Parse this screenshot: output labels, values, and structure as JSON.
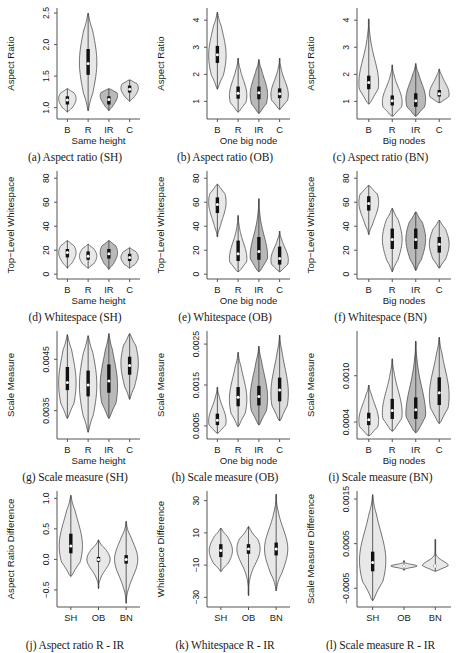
{
  "figure": {
    "title": "",
    "rows": 4,
    "cols": 3,
    "colors": {
      "fill_light": "#e8e8e8",
      "fill_mid": "#dcdcdc",
      "fill_dark": "#b9b9b9",
      "stroke": "#3a3a3a",
      "box": "#111111",
      "median": "#ffffff",
      "axis": "#555555"
    }
  },
  "chart_data": [
    {
      "id": "a",
      "type": "violin",
      "caption": "(a) Aspect ratio (SH)",
      "ylabel": "Aspect Ratio",
      "xlabel": "Same height",
      "categories": [
        "B",
        "R",
        "IR",
        "C"
      ],
      "yticks": [
        1.0,
        1.5,
        2.0,
        2.5
      ],
      "yticklabels": [
        "1.0",
        "1.5",
        "2.0",
        "2.5"
      ],
      "ylim": [
        0.82,
        2.58
      ],
      "series": [
        {
          "name": "B",
          "shade": "fill_light",
          "min": 0.93,
          "max": 1.3,
          "q1": 1.05,
          "q3": 1.18,
          "median": 1.12,
          "peak": 1.14,
          "width": 0.66,
          "bulge": 0.8
        },
        {
          "name": "R",
          "shade": "fill_light",
          "min": 0.95,
          "max": 2.5,
          "q1": 1.52,
          "q3": 1.93,
          "median": 1.7,
          "peak": 1.72,
          "width": 1.0,
          "bulge": 0.55
        },
        {
          "name": "IR",
          "shade": "fill_dark",
          "min": 0.95,
          "max": 1.3,
          "q1": 1.05,
          "q3": 1.18,
          "median": 1.13,
          "peak": 1.19,
          "width": 0.62,
          "bulge": 0.85
        },
        {
          "name": "C",
          "shade": "fill_mid",
          "min": 1.1,
          "max": 1.44,
          "q1": 1.24,
          "q3": 1.35,
          "median": 1.29,
          "peak": 1.31,
          "width": 0.6,
          "bulge": 0.82
        }
      ]
    },
    {
      "id": "b",
      "type": "violin",
      "caption": "(b) Aspect ratio (OB)",
      "ylabel": "Aspect Ratio",
      "xlabel": "One big node",
      "categories": [
        "B",
        "R",
        "IR",
        "C"
      ],
      "yticks": [
        1,
        2,
        3,
        4
      ],
      "yticklabels": [
        "1",
        "2",
        "3",
        "4"
      ],
      "ylim": [
        0.35,
        4.45
      ],
      "series": [
        {
          "name": "B",
          "shade": "fill_light",
          "min": 1.45,
          "max": 4.3,
          "q1": 2.42,
          "q3": 3.05,
          "median": 2.72,
          "peak": 2.7,
          "width": 0.9,
          "bulge": 0.6
        },
        {
          "name": "R",
          "shade": "fill_light",
          "min": 0.6,
          "max": 2.6,
          "q1": 1.1,
          "q3": 1.55,
          "median": 1.3,
          "peak": 1.22,
          "width": 0.8,
          "bulge": 0.55
        },
        {
          "name": "IR",
          "shade": "fill_dark",
          "min": 0.55,
          "max": 2.55,
          "q1": 1.08,
          "q3": 1.55,
          "median": 1.32,
          "peak": 1.25,
          "width": 0.82,
          "bulge": 0.6
        },
        {
          "name": "C",
          "shade": "fill_mid",
          "min": 0.7,
          "max": 2.6,
          "q1": 1.12,
          "q3": 1.48,
          "median": 1.28,
          "peak": 1.25,
          "width": 0.74,
          "bulge": 0.5
        }
      ]
    },
    {
      "id": "c",
      "type": "violin",
      "caption": "(c) Aspect ratio (BN)",
      "ylabel": "Aspect Ratio",
      "xlabel": "Big nodes",
      "categories": [
        "B",
        "R",
        "IR",
        "C"
      ],
      "yticks": [
        1,
        2,
        3,
        4
      ],
      "yticklabels": [
        "1",
        "2",
        "3",
        "4"
      ],
      "ylim": [
        0.35,
        4.45
      ],
      "series": [
        {
          "name": "B",
          "shade": "fill_light",
          "min": 0.9,
          "max": 4.05,
          "q1": 1.45,
          "q3": 1.95,
          "median": 1.7,
          "peak": 1.68,
          "width": 0.88,
          "bulge": 0.52
        },
        {
          "name": "R",
          "shade": "fill_light",
          "min": 0.45,
          "max": 2.35,
          "q1": 0.85,
          "q3": 1.22,
          "median": 1.02,
          "peak": 0.98,
          "width": 0.78,
          "bulge": 0.55
        },
        {
          "name": "IR",
          "shade": "fill_dark",
          "min": 0.45,
          "max": 2.4,
          "q1": 0.8,
          "q3": 1.3,
          "median": 1.02,
          "peak": 1.08,
          "width": 0.86,
          "bulge": 0.62
        },
        {
          "name": "C",
          "shade": "fill_mid",
          "min": 0.95,
          "max": 2.2,
          "q1": 1.18,
          "q3": 1.42,
          "median": 1.28,
          "peak": 1.28,
          "width": 0.62,
          "bulge": 0.7
        }
      ]
    },
    {
      "id": "d",
      "type": "violin",
      "caption": "(d) Whitespace (SH)",
      "ylabel": "Top−Level Whitespace",
      "xlabel": "Same height",
      "categories": [
        "B",
        "R",
        "IR",
        "C"
      ],
      "yticks": [
        0,
        20,
        40,
        60,
        80
      ],
      "yticklabels": [
        "0",
        "20",
        "40",
        "60",
        "80"
      ],
      "ylim": [
        -4,
        86
      ],
      "series": [
        {
          "name": "B",
          "shade": "fill_light",
          "min": 5,
          "max": 28,
          "q1": 14,
          "q3": 21,
          "median": 18,
          "peak": 18,
          "width": 0.62,
          "bulge": 0.72
        },
        {
          "name": "R",
          "shade": "fill_light",
          "min": 5,
          "max": 25,
          "q1": 12,
          "q3": 19,
          "median": 15,
          "peak": 15,
          "width": 0.58,
          "bulge": 0.74
        },
        {
          "name": "IR",
          "shade": "fill_dark",
          "min": 4,
          "max": 28,
          "q1": 13,
          "q3": 21,
          "median": 17,
          "peak": 18,
          "width": 0.72,
          "bulge": 0.76
        },
        {
          "name": "C",
          "shade": "fill_mid",
          "min": 5,
          "max": 22,
          "q1": 11,
          "q3": 17,
          "median": 14,
          "peak": 14,
          "width": 0.56,
          "bulge": 0.76
        }
      ]
    },
    {
      "id": "e",
      "type": "violin",
      "caption": "(e) Whitespace (OB)",
      "ylabel": "Top−Level Whitespace",
      "xlabel": "One big node",
      "categories": [
        "B",
        "R",
        "IR",
        "C"
      ],
      "yticks": [
        0,
        20,
        40,
        60,
        80
      ],
      "yticklabels": [
        "0",
        "20",
        "40",
        "60",
        "80"
      ],
      "ylim": [
        -4,
        86
      ],
      "series": [
        {
          "name": "B",
          "shade": "fill_light",
          "min": 31,
          "max": 75,
          "q1": 51,
          "q3": 64,
          "median": 58,
          "peak": 60,
          "width": 0.72,
          "bulge": 0.62
        },
        {
          "name": "R",
          "shade": "fill_light",
          "min": 2,
          "max": 49,
          "q1": 11,
          "q3": 28,
          "median": 17,
          "peak": 13,
          "width": 0.76,
          "bulge": 0.55
        },
        {
          "name": "IR",
          "shade": "fill_dark",
          "min": 2,
          "max": 63,
          "q1": 12,
          "q3": 31,
          "median": 19,
          "peak": 15,
          "width": 0.9,
          "bulge": 0.52
        },
        {
          "name": "C",
          "shade": "fill_mid",
          "min": 2,
          "max": 36,
          "q1": 8,
          "q3": 23,
          "median": 13,
          "peak": 12,
          "width": 0.62,
          "bulge": 0.58
        }
      ]
    },
    {
      "id": "f",
      "type": "violin",
      "caption": "(f) Whitespace (BN)",
      "ylabel": "Top−Level Whitespace",
      "xlabel": "Big nodes",
      "categories": [
        "B",
        "R",
        "IR",
        "C"
      ],
      "yticks": [
        0,
        20,
        40,
        60,
        80
      ],
      "yticklabels": [
        "0",
        "20",
        "40",
        "60",
        "80"
      ],
      "ylim": [
        -4,
        86
      ],
      "series": [
        {
          "name": "B",
          "shade": "fill_light",
          "min": 33,
          "max": 74,
          "q1": 53,
          "q3": 65,
          "median": 59,
          "peak": 60,
          "width": 0.72,
          "bulge": 0.68
        },
        {
          "name": "R",
          "shade": "fill_light",
          "min": 2,
          "max": 55,
          "q1": 21,
          "q3": 38,
          "median": 29,
          "peak": 29,
          "width": 0.78,
          "bulge": 0.62
        },
        {
          "name": "IR",
          "shade": "fill_dark",
          "min": 3,
          "max": 52,
          "q1": 21,
          "q3": 38,
          "median": 29,
          "peak": 29,
          "width": 0.8,
          "bulge": 0.68
        },
        {
          "name": "C",
          "shade": "fill_mid",
          "min": 5,
          "max": 45,
          "q1": 18,
          "q3": 31,
          "median": 25,
          "peak": 25,
          "width": 0.66,
          "bulge": 0.7
        }
      ]
    },
    {
      "id": "g",
      "type": "violin",
      "caption": "(g) Scale measure (SH)",
      "ylabel": "Scale Measure",
      "xlabel": "Same height",
      "categories": [
        "B",
        "R",
        "IR",
        "C"
      ],
      "yticks": [
        0.0035,
        0.0045
      ],
      "yticklabels": [
        "0.0035",
        "0.0045"
      ],
      "ylim": [
        0.00295,
        0.00505
      ],
      "series": [
        {
          "name": "B",
          "shade": "fill_light",
          "min": 0.00335,
          "max": 0.00498,
          "q1": 0.0039,
          "q3": 0.00435,
          "median": 0.00405,
          "peak": 0.00404,
          "width": 0.72,
          "bulge": 0.7
        },
        {
          "name": "R",
          "shade": "fill_light",
          "min": 0.00308,
          "max": 0.00496,
          "q1": 0.00378,
          "q3": 0.00428,
          "median": 0.004,
          "peak": 0.004,
          "width": 0.74,
          "bulge": 0.62
        },
        {
          "name": "IR",
          "shade": "fill_dark",
          "min": 0.00335,
          "max": 0.005,
          "q1": 0.00385,
          "q3": 0.0044,
          "median": 0.00408,
          "peak": 0.00398,
          "width": 0.8,
          "bulge": 0.66
        },
        {
          "name": "C",
          "shade": "fill_mid",
          "min": 0.00372,
          "max": 0.005,
          "q1": 0.0042,
          "q3": 0.00455,
          "median": 0.00438,
          "peak": 0.00442,
          "width": 0.7,
          "bulge": 0.7
        }
      ]
    },
    {
      "id": "h",
      "type": "violin",
      "caption": "(h) Scale measure (OB)",
      "ylabel": "Scale Measure",
      "xlabel": "One big node",
      "categories": [
        "B",
        "R",
        "IR",
        "C"
      ],
      "yticks": [
        0.0005,
        0.0015,
        0.0025
      ],
      "yticklabels": [
        "0.0005",
        "0.0015",
        "0.0025"
      ],
      "ylim": [
        0.00018,
        0.00282
      ],
      "series": [
        {
          "name": "B",
          "shade": "fill_light",
          "min": 0.00032,
          "max": 0.00145,
          "q1": 0.00052,
          "q3": 0.0008,
          "median": 0.00064,
          "peak": 0.00062,
          "width": 0.66,
          "bulge": 0.6
        },
        {
          "name": "R",
          "shade": "fill_light",
          "min": 0.00048,
          "max": 0.0023,
          "q1": 0.00098,
          "q3": 0.00145,
          "median": 0.0012,
          "peak": 0.00115,
          "width": 0.82,
          "bulge": 0.58
        },
        {
          "name": "IR",
          "shade": "fill_dark",
          "min": 0.00052,
          "max": 0.00245,
          "q1": 0.001,
          "q3": 0.00148,
          "median": 0.00122,
          "peak": 0.00118,
          "width": 0.82,
          "bulge": 0.62
        },
        {
          "name": "C",
          "shade": "fill_mid",
          "min": 0.00062,
          "max": 0.00272,
          "q1": 0.0011,
          "q3": 0.00168,
          "median": 0.00138,
          "peak": 0.0013,
          "width": 0.82,
          "bulge": 0.6
        }
      ]
    },
    {
      "id": "i",
      "type": "violin",
      "caption": "(i) Scale measure (BN)",
      "ylabel": "Scale Measure",
      "xlabel": "Big nodes",
      "categories": [
        "B",
        "R",
        "IR",
        "C"
      ],
      "yticks": [
        0.0004,
        0.001
      ],
      "yticklabels": [
        "0.0004",
        "0.0010"
      ],
      "ylim": [
        0.00018,
        0.00158
      ],
      "series": [
        {
          "name": "B",
          "shade": "fill_light",
          "min": 0.00022,
          "max": 0.00088,
          "q1": 0.00036,
          "q3": 0.00052,
          "median": 0.00043,
          "peak": 0.00042,
          "width": 0.64,
          "bulge": 0.66
        },
        {
          "name": "R",
          "shade": "fill_light",
          "min": 0.00028,
          "max": 0.00122,
          "q1": 0.00044,
          "q3": 0.0007,
          "median": 0.00055,
          "peak": 0.00052,
          "width": 0.74,
          "bulge": 0.62
        },
        {
          "name": "IR",
          "shade": "fill_dark",
          "min": 0.00026,
          "max": 0.00145,
          "q1": 0.00044,
          "q3": 0.00072,
          "median": 0.00056,
          "peak": 0.0005,
          "width": 0.78,
          "bulge": 0.58
        },
        {
          "name": "C",
          "shade": "fill_mid",
          "min": 0.00038,
          "max": 0.0015,
          "q1": 0.00062,
          "q3": 0.00098,
          "median": 0.00078,
          "peak": 0.00074,
          "width": 0.8,
          "bulge": 0.62
        }
      ]
    },
    {
      "id": "j",
      "type": "violin",
      "caption": "(j) Aspect ratio R - IR",
      "ylabel": "Aspect Ratio Difference",
      "xlabel": "",
      "categories": [
        "SH",
        "OB",
        "BN"
      ],
      "yticks": [
        -0.5,
        0.0,
        0.5,
        1.0
      ],
      "yticklabels": [
        "−0.5",
        "0.0",
        "0.5",
        "1.0"
      ],
      "ylim": [
        -0.78,
        1.12
      ],
      "series": [
        {
          "name": "SH",
          "shade": "fill_light",
          "min": -0.28,
          "max": 1.05,
          "q1": 0.1,
          "q3": 0.42,
          "median": 0.22,
          "peak": 0.22,
          "width": 0.76,
          "bulge": 0.62
        },
        {
          "name": "OB",
          "shade": "fill_light",
          "min": -0.48,
          "max": 0.32,
          "q1": -0.04,
          "q3": 0.04,
          "median": 0.0,
          "peak": 0.0,
          "width": 0.4,
          "bulge": 0.3
        },
        {
          "name": "BN",
          "shade": "fill_light",
          "min": -0.72,
          "max": 0.62,
          "q1": -0.07,
          "q3": 0.07,
          "median": 0.0,
          "peak": 0.0,
          "width": 0.56,
          "bulge": 0.28
        }
      ]
    },
    {
      "id": "k",
      "type": "violin",
      "caption": "(k) Whitespace R - IR",
      "ylabel": "Whitespace Difference",
      "xlabel": "",
      "categories": [
        "SH",
        "OB",
        "BN"
      ],
      "yticks": [
        -30,
        -10,
        10,
        30
      ],
      "yticklabels": [
        "−30",
        "−10",
        "10",
        "30"
      ],
      "ylim": [
        -36,
        36
      ],
      "series": [
        {
          "name": "SH",
          "shade": "fill_light",
          "min": -14,
          "max": 13,
          "q1": -5,
          "q3": 3,
          "median": -1,
          "peak": -1,
          "width": 0.56,
          "bulge": 0.62
        },
        {
          "name": "OB",
          "shade": "fill_light",
          "min": -29,
          "max": 14,
          "q1": -3,
          "q3": 3,
          "median": 0,
          "peak": 0,
          "width": 0.5,
          "bulge": 0.3
        },
        {
          "name": "BN",
          "shade": "fill_light",
          "min": -26,
          "max": 34,
          "q1": -4,
          "q3": 4,
          "median": 0,
          "peak": 0,
          "width": 0.62,
          "bulge": 0.3
        }
      ]
    },
    {
      "id": "l",
      "type": "violin",
      "caption": "(l) Scale measure R - IR",
      "ylabel": "Scale Measure Difference",
      "xlabel": "",
      "categories": [
        "SH",
        "OB",
        "BN"
      ],
      "yticks": [
        -0.0005,
        0.0005,
        0.0015
      ],
      "yticklabels": [
        "−0.0005",
        "0.0005",
        "0.0015"
      ],
      "ylim": [
        -0.00092,
        0.00168
      ],
      "series": [
        {
          "name": "SH",
          "shade": "fill_light",
          "min": -0.00078,
          "max": 0.0016,
          "q1": -0.00012,
          "q3": 0.00032,
          "median": 8e-05,
          "peak": 0.00012,
          "width": 0.62,
          "bulge": 0.52
        },
        {
          "name": "OB",
          "shade": "fill_light",
          "min": -0.0001,
          "max": 0.00012,
          "q1": -1e-05,
          "q3": 1e-05,
          "median": 0.0,
          "peak": 0.0,
          "width": 0.44,
          "bulge": 0.1
        },
        {
          "name": "BN",
          "shade": "fill_light",
          "min": -0.00012,
          "max": 0.0006,
          "q1": -2e-05,
          "q3": 2e-05,
          "median": 0.0,
          "peak": 0.0,
          "width": 0.52,
          "bulge": 0.1
        }
      ]
    }
  ]
}
